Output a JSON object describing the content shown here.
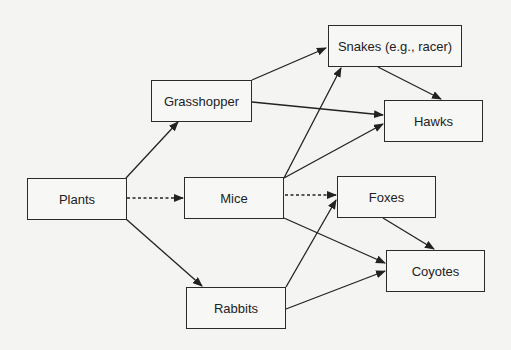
{
  "diagram": {
    "background": "#f4f4f3",
    "line_color": "#222222",
    "nodes": {
      "plants": {
        "label": "Plants",
        "x": 27,
        "y": 178,
        "w": 100,
        "h": 42
      },
      "grasshopper": {
        "label": "Grasshopper",
        "x": 151,
        "y": 80,
        "w": 101,
        "h": 42
      },
      "mice": {
        "label": "Mice",
        "x": 184,
        "y": 177,
        "w": 100,
        "h": 42
      },
      "rabbits": {
        "label": "Rabbits",
        "x": 186,
        "y": 287,
        "w": 100,
        "h": 42
      },
      "snakes": {
        "label": "Snakes (e.g., racer)",
        "x": 328,
        "y": 25,
        "w": 134,
        "h": 42
      },
      "hawks": {
        "label": "Hawks",
        "x": 384,
        "y": 100,
        "w": 99,
        "h": 42
      },
      "foxes": {
        "label": "Foxes",
        "x": 337,
        "y": 176,
        "w": 99,
        "h": 42
      },
      "coyotes": {
        "label": "Coyotes",
        "x": 386,
        "y": 250,
        "w": 99,
        "h": 42
      }
    },
    "edges": [
      {
        "from": "plants",
        "to": "grasshopper",
        "style": "solid",
        "x1": 126,
        "y1": 178,
        "x2": 178,
        "y2": 122
      },
      {
        "from": "plants",
        "to": "mice",
        "style": "dashed",
        "x1": 127,
        "y1": 198,
        "x2": 183,
        "y2": 198
      },
      {
        "from": "plants",
        "to": "rabbits",
        "style": "solid",
        "x1": 126,
        "y1": 219,
        "x2": 202,
        "y2": 286
      },
      {
        "from": "grasshopper",
        "to": "snakes",
        "style": "solid",
        "x1": 252,
        "y1": 80,
        "x2": 326,
        "y2": 48
      },
      {
        "from": "grasshopper",
        "to": "hawks",
        "style": "solid",
        "x1": 252,
        "y1": 102,
        "x2": 383,
        "y2": 115
      },
      {
        "from": "mice",
        "to": "snakes",
        "style": "solid",
        "x1": 284,
        "y1": 178,
        "x2": 341,
        "y2": 68
      },
      {
        "from": "mice",
        "to": "hawks",
        "style": "solid",
        "x1": 284,
        "y1": 178,
        "x2": 383,
        "y2": 124
      },
      {
        "from": "mice",
        "to": "foxes",
        "style": "dashed",
        "x1": 285,
        "y1": 195,
        "x2": 336,
        "y2": 195
      },
      {
        "from": "mice",
        "to": "coyotes",
        "style": "solid",
        "x1": 284,
        "y1": 218,
        "x2": 385,
        "y2": 263
      },
      {
        "from": "rabbits",
        "to": "foxes",
        "style": "solid",
        "x1": 286,
        "y1": 287,
        "x2": 336,
        "y2": 200
      },
      {
        "from": "rabbits",
        "to": "coyotes",
        "style": "solid",
        "x1": 286,
        "y1": 309,
        "x2": 385,
        "y2": 271
      },
      {
        "from": "snakes",
        "to": "hawks",
        "style": "solid",
        "x1": 378,
        "y1": 67,
        "x2": 441,
        "y2": 99
      },
      {
        "from": "foxes",
        "to": "coyotes",
        "style": "solid",
        "x1": 383,
        "y1": 218,
        "x2": 434,
        "y2": 249
      }
    ]
  }
}
